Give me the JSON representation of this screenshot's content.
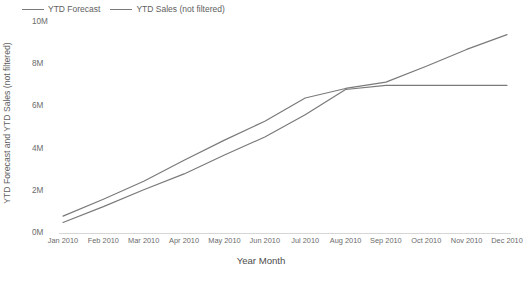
{
  "legend": {
    "position": "top-left",
    "items": [
      {
        "label": "YTD Forecast",
        "color": "#7a7a7a",
        "icon": "line-swatch-icon"
      },
      {
        "label": "YTD Sales (not filtered)",
        "color": "#7a7a7a",
        "icon": "line-swatch-icon"
      }
    ]
  },
  "axes": {
    "y_title": "YTD Forecast and YTD Sales (not filtered)",
    "x_title": "Year Month"
  },
  "chart_data": {
    "type": "line",
    "title": "",
    "subtitle": "",
    "xlabel": "Year Month",
    "ylabel": "YTD Forecast and YTD Sales (not filtered)",
    "categories": [
      "Jan 2010",
      "Feb 2010",
      "Mar 2010",
      "Apr 2010",
      "May 2010",
      "Jun 2010",
      "Jul 2010",
      "Aug 2010",
      "Sep 2010",
      "Oct 2010",
      "Nov 2010",
      "Dec 2010"
    ],
    "ylim": [
      0,
      10000000
    ],
    "ytick_labels": [
      "0M",
      "2M",
      "4M",
      "6M",
      "8M",
      "10M"
    ],
    "ytick_values": [
      0,
      2000000,
      4000000,
      6000000,
      8000000,
      10000000
    ],
    "grid": false,
    "legend_position": "top-left",
    "series": [
      {
        "name": "YTD Forecast",
        "color": "#7a7a7a",
        "values": [
          800000,
          1600000,
          2450000,
          3450000,
          4400000,
          5300000,
          6400000,
          6850000,
          7150000,
          7900000,
          8700000,
          9400000
        ]
      },
      {
        "name": "YTD Sales (not filtered)",
        "color": "#7a7a7a",
        "values": [
          500000,
          1250000,
          2050000,
          2800000,
          3700000,
          4550000,
          5600000,
          6800000,
          7000000,
          7000000,
          7000000,
          7000000
        ]
      }
    ]
  }
}
